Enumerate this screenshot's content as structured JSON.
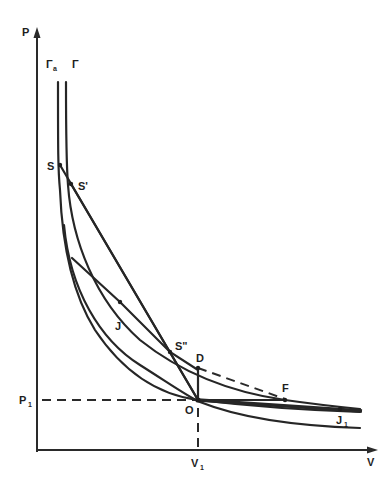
{
  "diagram": {
    "type": "P-V shock adiabat diagram (Hugoniot curves with Rayleigh lines)",
    "axes": {
      "y_label": "P",
      "x_label": "V",
      "p1_label": "P",
      "p1_sub": "1",
      "v1_label": "V",
      "v1_sub": "1"
    },
    "curves": {
      "gamma_a_label": "Γ",
      "gamma_a_sub": "a",
      "gamma_label": "Γ"
    },
    "points": {
      "S": "S",
      "S_prime": "S'",
      "S_double_prime": "S\"",
      "J": "J",
      "D": "D",
      "F": "F",
      "O": "O",
      "J1": "J",
      "J1_sub": "1"
    },
    "colors": {
      "ink": "#262626",
      "background": "#ffffff"
    }
  }
}
